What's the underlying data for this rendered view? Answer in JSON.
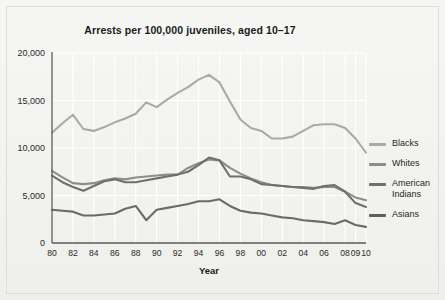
{
  "chart_data": {
    "type": "line",
    "title": "Arrests per 100,000 juveniles, aged 10–17",
    "xlabel": "Year",
    "ylabel": "",
    "ylim": [
      0,
      20000
    ],
    "yticks": [
      0,
      5000,
      10000,
      15000,
      20000
    ],
    "ytick_labels": [
      "0",
      "5,000",
      "10,000",
      "15,000",
      "20,000"
    ],
    "grid": true,
    "legend_position": "right",
    "x": [
      1980,
      1981,
      1982,
      1983,
      1984,
      1985,
      1986,
      1987,
      1988,
      1989,
      1990,
      1991,
      1992,
      1993,
      1994,
      1995,
      1996,
      1997,
      1998,
      1999,
      2000,
      2001,
      2002,
      2003,
      2004,
      2005,
      2006,
      2007,
      2008,
      2009,
      2010
    ],
    "xtick_values": [
      1980,
      1982,
      1984,
      1986,
      1988,
      1990,
      1992,
      1994,
      1996,
      1998,
      2000,
      2002,
      2004,
      2006,
      2008,
      2009,
      2010
    ],
    "xtick_labels": [
      "80",
      "82",
      "84",
      "86",
      "88",
      "90",
      "92",
      "94",
      "96",
      "98",
      "00",
      "02",
      "04",
      "06",
      "08",
      "09",
      "10"
    ],
    "series": [
      {
        "name": "Blacks",
        "color": "#a9a9a9",
        "values": [
          11600,
          12600,
          13500,
          12000,
          11800,
          12200,
          12700,
          13100,
          13600,
          14800,
          14300,
          15100,
          15800,
          16400,
          17200,
          17700,
          16900,
          14900,
          13000,
          12100,
          11800,
          11000,
          11000,
          11200,
          11800,
          12400,
          12500,
          12500,
          12100,
          11000,
          9500
        ]
      },
      {
        "name": "Whites",
        "color": "#8d8d8d",
        "values": [
          7600,
          6900,
          6300,
          6200,
          6300,
          6600,
          6800,
          6700,
          6900,
          7000,
          7100,
          7200,
          7200,
          7900,
          8400,
          8800,
          8700,
          7900,
          7300,
          6800,
          6400,
          6100,
          6000,
          5900,
          5900,
          5800,
          5900,
          5900,
          5400,
          4800,
          4500
        ]
      },
      {
        "name": "American Indians",
        "color": "#6f6f6f",
        "values": [
          7100,
          6400,
          5900,
          5500,
          6000,
          6500,
          6700,
          6400,
          6400,
          6600,
          6800,
          7000,
          7200,
          7500,
          8200,
          9000,
          8700,
          7000,
          7000,
          6700,
          6200,
          6100,
          6000,
          5900,
          5800,
          5700,
          6000,
          6100,
          5400,
          4200,
          3800
        ]
      },
      {
        "name": "Asians",
        "color": "#6a6a6a",
        "values": [
          3500,
          3400,
          3300,
          2900,
          2900,
          3000,
          3100,
          3600,
          3900,
          2400,
          3500,
          3700,
          3900,
          4100,
          4400,
          4400,
          4600,
          3900,
          3400,
          3200,
          3100,
          2900,
          2700,
          2600,
          2400,
          2300,
          2200,
          2000,
          2400,
          1900,
          1700
        ]
      }
    ]
  },
  "legend": {
    "items": [
      {
        "label": "Blacks",
        "color": "#a9a9a9"
      },
      {
        "label": "Whites",
        "color": "#8d8d8d"
      },
      {
        "label": "American Indians",
        "color": "#6f6f6f"
      },
      {
        "label": "Asians",
        "color": "#5f5f5f"
      }
    ]
  }
}
